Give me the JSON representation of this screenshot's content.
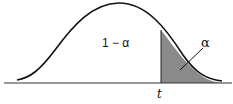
{
  "figure": {
    "type": "normal-distribution-tail-area",
    "labels": {
      "body_area": "1 − α",
      "tail_area": "α",
      "cutoff": "t"
    },
    "colors": {
      "curve": "#111111",
      "axis": "#333333",
      "tail_fill": "#8a8a8a",
      "background": "#ffffff"
    }
  }
}
